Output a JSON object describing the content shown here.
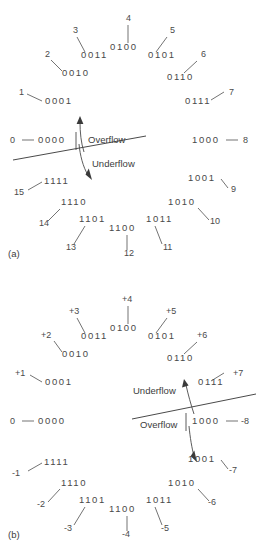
{
  "figure": {
    "title_implicit": "Number circle representations of 4-bit values",
    "panels": [
      {
        "id": "a",
        "label": "(a)",
        "scheme": "unsigned",
        "flow_upper_label": "Overflow",
        "flow_lower_label": "Underflow",
        "nodes": [
          {
            "binary": "0000",
            "decimal": "0",
            "bx": 38,
            "by": 143,
            "dx": 10,
            "dy": 143,
            "leader": [
              22,
              140,
              34,
              140
            ]
          },
          {
            "binary": "0001",
            "decimal": "1",
            "bx": 45,
            "by": 104,
            "dx": 19,
            "dy": 95,
            "leader": [
              27,
              94,
              42,
              101
            ]
          },
          {
            "binary": "0010",
            "decimal": "2",
            "bx": 62,
            "by": 76,
            "dx": 45,
            "dy": 57,
            "leader": [
              51,
              60,
              62,
              71
            ]
          },
          {
            "binary": "0011",
            "decimal": "3",
            "bx": 81,
            "by": 58,
            "dx": 73,
            "dy": 33,
            "leader": [
              77,
              37,
              85,
              52
            ]
          },
          {
            "binary": "0100",
            "decimal": "4",
            "bx": 110,
            "by": 50,
            "dx": 126,
            "dy": 21,
            "leader": [
              128,
              25,
              128,
              43
            ]
          },
          {
            "binary": "0101",
            "decimal": "5",
            "bx": 148,
            "by": 58,
            "dx": 170,
            "dy": 33,
            "leader": [
              167,
              37,
              156,
              52
            ]
          },
          {
            "binary": "0110",
            "decimal": "6",
            "bx": 167,
            "by": 80,
            "dx": 201,
            "dy": 57,
            "leader": [
              197,
              61,
              184,
              73
            ]
          },
          {
            "binary": "0111",
            "decimal": "7",
            "bx": 185,
            "by": 104,
            "dx": 229,
            "dy": 95,
            "leader": [
              224,
              92,
              211,
              100
            ]
          },
          {
            "binary": "1000",
            "decimal": "8",
            "bx": 192,
            "by": 143,
            "dx": 243,
            "dy": 143,
            "leader": [
              226,
              140,
              238,
              140
            ]
          },
          {
            "binary": "1001",
            "decimal": "9",
            "bx": 188,
            "by": 181,
            "dx": 231,
            "dy": 192,
            "leader": [
              221,
              179,
              228,
              188
            ]
          },
          {
            "binary": "1010",
            "decimal": "10",
            "bx": 168,
            "by": 205,
            "dx": 210,
            "dy": 224,
            "leader": [
              198,
              208,
              209,
              220
            ]
          },
          {
            "binary": "1011",
            "decimal": "11",
            "bx": 146,
            "by": 222,
            "dx": 163,
            "dy": 250,
            "leader": [
              155,
              226,
              162,
              244
            ]
          },
          {
            "binary": "1100",
            "decimal": "12",
            "bx": 109,
            "by": 231,
            "dx": 124,
            "dy": 256,
            "leader": [
              127,
              235,
              127,
              250
            ]
          },
          {
            "binary": "1101",
            "decimal": "13",
            "bx": 79,
            "by": 222,
            "dx": 66,
            "dy": 250,
            "leader": [
              85,
              226,
              74,
              244
            ]
          },
          {
            "binary": "1110",
            "decimal": "14",
            "bx": 61,
            "by": 205,
            "dx": 39,
            "dy": 226,
            "leader": [
              60,
              209,
              48,
              221
            ]
          },
          {
            "binary": "1111",
            "decimal": "15",
            "bx": 44,
            "by": 184,
            "dx": 14,
            "dy": 195,
            "leader": [
              42,
              182,
              28,
              190
            ]
          }
        ]
      },
      {
        "id": "b",
        "label": "(b)",
        "scheme": "two's complement",
        "flow_upper_label": "Underflow",
        "flow_lower_label": "Overflow",
        "nodes": [
          {
            "binary": "0000",
            "decimal": "0",
            "bx": 38,
            "by": 424,
            "dx": 10,
            "dy": 424,
            "leader": [
              22,
              421,
              34,
              421
            ]
          },
          {
            "binary": "0001",
            "decimal": "+1",
            "bx": 45,
            "by": 385,
            "dx": 15,
            "dy": 376,
            "leader": [
              30,
              375,
              42,
              382
            ]
          },
          {
            "binary": "0010",
            "decimal": "+2",
            "bx": 62,
            "by": 357,
            "dx": 41,
            "dy": 338,
            "leader": [
              54,
              341,
              62,
              352
            ]
          },
          {
            "binary": "0011",
            "decimal": "+3",
            "bx": 81,
            "by": 339,
            "dx": 69,
            "dy": 314,
            "leader": [
              77,
              318,
              85,
              333
            ]
          },
          {
            "binary": "0100",
            "decimal": "+4",
            "bx": 110,
            "by": 331,
            "dx": 122,
            "dy": 302,
            "leader": [
              128,
              306,
              128,
              324
            ]
          },
          {
            "binary": "0101",
            "decimal": "+5",
            "bx": 148,
            "by": 339,
            "dx": 166,
            "dy": 314,
            "leader": [
              167,
              318,
              156,
              333
            ]
          },
          {
            "binary": "0110",
            "decimal": "+6",
            "bx": 167,
            "by": 361,
            "dx": 197,
            "dy": 338,
            "leader": [
              197,
              342,
              184,
              354
            ]
          },
          {
            "binary": "0111",
            "decimal": "+7",
            "bx": 185,
            "by": 385,
            "dx": 225,
            "dy": 376,
            "leader": [
              224,
              373,
              211,
              381
            ]
          },
          {
            "binary": "1000",
            "decimal": "-8",
            "bx": 192,
            "by": 424,
            "dx": 241,
            "dy": 424,
            "leader": [
              226,
              421,
              238,
              421
            ]
          },
          {
            "binary": "1001",
            "decimal": "-7",
            "bx": 188,
            "by": 462,
            "dx": 229,
            "dy": 473,
            "leader": [
              221,
              460,
              228,
              469
            ]
          },
          {
            "binary": "1010",
            "decimal": "-6",
            "bx": 168,
            "by": 486,
            "dx": 208,
            "dy": 505,
            "leader": [
              198,
              489,
              209,
              501
            ]
          },
          {
            "binary": "1011",
            "decimal": "-5",
            "bx": 146,
            "by": 503,
            "dx": 161,
            "dy": 531,
            "leader": [
              155,
              507,
              162,
              525
            ]
          },
          {
            "binary": "1100",
            "decimal": "-4",
            "bx": 109,
            "by": 512,
            "dx": 122,
            "dy": 537,
            "leader": [
              127,
              516,
              127,
              531
            ]
          },
          {
            "binary": "1101",
            "decimal": "-3",
            "bx": 79,
            "by": 503,
            "dx": 64,
            "dy": 531,
            "leader": [
              85,
              507,
              74,
              525
            ]
          },
          {
            "binary": "1110",
            "decimal": "-2",
            "bx": 61,
            "by": 486,
            "dx": 37,
            "dy": 507,
            "leader": [
              60,
              489,
              48,
              502
            ]
          },
          {
            "binary": "1111",
            "decimal": "-1",
            "bx": 44,
            "by": 465,
            "dx": 12,
            "dy": 476,
            "leader": [
              42,
              463,
              28,
              471
            ]
          }
        ]
      }
    ],
    "colors": {
      "text": "#4a4a4a",
      "line": "#5a5a5a",
      "background": "#ffffff"
    }
  }
}
